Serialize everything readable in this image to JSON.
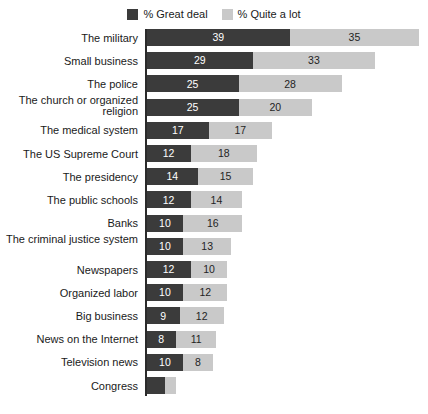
{
  "legend": {
    "entries": [
      {
        "label": "% Great deal",
        "color": "#3b3b3b",
        "swatch_name": "legend-swatch-great-deal"
      },
      {
        "label": "% Quite a lot",
        "color": "#c9c9c9",
        "swatch_name": "legend-swatch-quite-a-lot"
      }
    ]
  },
  "colors": {
    "great_deal": "#3b3b3b",
    "quite_a_lot": "#c9c9c9",
    "axis": "#2b2b2b",
    "background": "#ffffff",
    "text": "#1a1a1a"
  },
  "chart_data": {
    "type": "bar",
    "orientation": "horizontal",
    "stacked": true,
    "title": "",
    "subtitle": "",
    "xlabel": "",
    "ylabel": "",
    "grid": false,
    "legend_position": "top-center",
    "axis_visible": true,
    "xlim": [
      0,
      74
    ],
    "categories": [
      "The military",
      "Small business",
      "The police",
      "The church or organized religion",
      "The medical system",
      "The US Supreme Court",
      "The presidency",
      "The public schools",
      "Banks",
      "The criminal justice system",
      "Newspapers",
      "Organized labor",
      "Big business",
      "News on the Internet",
      "Television news",
      "Congress"
    ],
    "series": [
      {
        "name": "% Great deal",
        "color": "#3b3b3b",
        "values": [
          39,
          29,
          25,
          25,
          17,
          12,
          14,
          12,
          10,
          10,
          12,
          10,
          9,
          8,
          10,
          5
        ]
      },
      {
        "name": "% Quite a lot",
        "color": "#c9c9c9",
        "values": [
          35,
          33,
          28,
          20,
          17,
          18,
          15,
          14,
          16,
          13,
          10,
          12,
          12,
          11,
          8,
          3
        ]
      }
    ],
    "totals": [
      74,
      62,
      53,
      45,
      34,
      30,
      29,
      26,
      26,
      23,
      22,
      22,
      21,
      19,
      18,
      8
    ],
    "data_labels_shown": [
      true,
      true,
      true,
      true,
      true,
      true,
      true,
      true,
      true,
      true,
      true,
      true,
      true,
      true,
      true,
      false
    ]
  },
  "layout": {
    "px_per_unit": 3.68,
    "row_pitch": 23.2,
    "bar_height": 17
  }
}
